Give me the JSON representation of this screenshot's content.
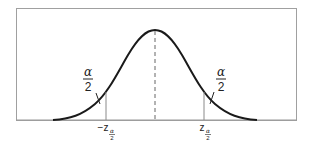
{
  "diagram": {
    "type": "normal-distribution-two-tailed",
    "left_tail_label": {
      "numerator": "α",
      "denominator": "2"
    },
    "right_tail_label": {
      "numerator": "α",
      "denominator": "2"
    },
    "left_critical": {
      "main": "−z",
      "sub_num": "α",
      "sub_den": "2"
    },
    "right_critical": {
      "main": "z",
      "sub_num": "α",
      "sub_den": "2"
    },
    "center_line": "dashed",
    "colors": {
      "curve": "#1a1a1a",
      "frame": "#9a9a9a",
      "axis": "#9a9a9a",
      "lines": "#8a8a8a"
    }
  }
}
